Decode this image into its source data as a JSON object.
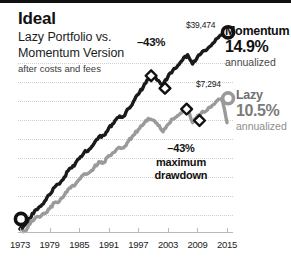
{
  "header": {
    "title": "Ideal",
    "subtitle_line1": "Lazy Portfolio vs.",
    "subtitle_line2": "Momentum Version",
    "footnote": "after costs and fees"
  },
  "annotations": {
    "drawdown_top": "–43%",
    "drawdown_caption_line1": "–43%",
    "drawdown_caption_line2": "maximum",
    "drawdown_caption_line3": "drawdown"
  },
  "callouts": {
    "momentum_value": "$39,474",
    "lazy_value": "$7,294"
  },
  "legend": {
    "momentum": {
      "name": "Momentum",
      "percent": "14.9%",
      "note": "annualized",
      "color": "#1a1a1a"
    },
    "lazy": {
      "name": "Lazy",
      "percent": "10.5%",
      "note": "annualized",
      "color": "#9a9a9a"
    }
  },
  "chart_data": {
    "type": "line",
    "title": "Ideal",
    "subtitle": "Lazy Portfolio vs. Momentum Version",
    "note": "after costs and fees",
    "xlabel": "",
    "ylabel": "",
    "grid": true,
    "legend_position": "right",
    "xlim": [
      1973,
      2016
    ],
    "ylim": [
      1000,
      42000
    ],
    "yscale": "log",
    "xticks": [
      1973,
      1979,
      1985,
      1991,
      1997,
      2003,
      2009,
      2015
    ],
    "xticklabels": [
      "1973",
      "1979",
      "1985",
      "1991",
      "1997",
      "2003",
      "2009",
      "2015"
    ],
    "start_marker": {
      "x": 1973,
      "label": "start"
    },
    "series": [
      {
        "name": "Momentum",
        "color": "#1a1a1a",
        "end_value": 39474,
        "end_label": "$39,474",
        "annualized": "14.9%",
        "max_drawdown": "-43%",
        "x": [
          1973,
          1974,
          1975,
          1976,
          1977,
          1978,
          1979,
          1980,
          1981,
          1982,
          1983,
          1984,
          1985,
          1986,
          1987,
          1988,
          1989,
          1990,
          1991,
          1992,
          1993,
          1994,
          1995,
          1996,
          1997,
          1998,
          1999,
          2000,
          2001,
          2002,
          2003,
          2004,
          2005,
          2006,
          2007,
          2008,
          2009,
          2010,
          2011,
          2012,
          2013,
          2014,
          2015
        ],
        "y": [
          1000,
          1080,
          1230,
          1410,
          1520,
          1680,
          1900,
          2180,
          2320,
          2640,
          3080,
          3250,
          3720,
          4180,
          4420,
          4930,
          5600,
          5750,
          6600,
          7200,
          8050,
          8200,
          9500,
          10800,
          12400,
          14200,
          16500,
          17200,
          16100,
          14900,
          17200,
          19400,
          21200,
          23600,
          25900,
          21800,
          24900,
          27600,
          28900,
          31800,
          35200,
          37500,
          39474
        ]
      },
      {
        "name": "Lazy",
        "color": "#9a9a9a",
        "end_value": 7294,
        "end_label": "$7,294",
        "annualized": "10.5%",
        "max_drawdown": "-43%",
        "x": [
          1973,
          1974,
          1975,
          1976,
          1977,
          1978,
          1979,
          1980,
          1981,
          1982,
          1983,
          1984,
          1985,
          1986,
          1987,
          1988,
          1989,
          1990,
          1991,
          1992,
          1993,
          1994,
          1995,
          1996,
          1997,
          1998,
          1999,
          2000,
          2001,
          2002,
          2003,
          2004,
          2005,
          2006,
          2007,
          2008,
          2009,
          2010,
          2011,
          2012,
          2013,
          2014,
          2015
        ],
        "y": [
          1000,
          960,
          1090,
          1220,
          1250,
          1330,
          1460,
          1640,
          1680,
          1880,
          2150,
          2230,
          2520,
          2800,
          2860,
          3140,
          3520,
          3450,
          3930,
          4180,
          4580,
          4560,
          5180,
          5760,
          6420,
          7050,
          7900,
          7650,
          6950,
          6150,
          7050,
          7800,
          8350,
          9100,
          9750,
          7300,
          8300,
          9000,
          9250,
          10100,
          11000,
          11500,
          7294
        ]
      }
    ],
    "drawdown_markers": [
      {
        "series": "Momentum",
        "type": "diamond",
        "x": 2000,
        "role": "peak"
      },
      {
        "series": "Momentum",
        "type": "diamond",
        "x": 2002,
        "role": "trough"
      },
      {
        "series": "Lazy",
        "type": "diamond",
        "x": 2007,
        "role": "peak"
      },
      {
        "series": "Lazy",
        "type": "diamond",
        "x": 2009,
        "role": "trough"
      }
    ]
  }
}
